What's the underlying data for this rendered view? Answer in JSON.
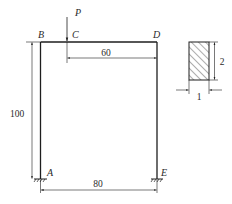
{
  "diagram": {
    "type": "portal-frame",
    "nodes": {
      "A": "A",
      "B": "B",
      "C": "C",
      "D": "D",
      "E": "E"
    },
    "load": {
      "label": "P",
      "at": "C",
      "direction": "down"
    },
    "dimensions": {
      "height": "100",
      "span": "80",
      "c_to_d": "60"
    },
    "section": {
      "shape": "rectangle",
      "hatched": true,
      "height": "2",
      "width": "1"
    },
    "colors": {
      "line": "#1e1e1e",
      "text": "#2a2a2a",
      "background": "#ffffff"
    }
  }
}
